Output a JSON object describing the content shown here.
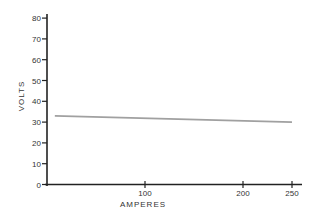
{
  "chart_data": {
    "type": "line",
    "title": "",
    "xlabel": "AMPERES",
    "ylabel": "VOLTS",
    "xlim": [
      0,
      255
    ],
    "ylim": [
      0,
      82
    ],
    "x_ticks": [
      100,
      200,
      250
    ],
    "x_tick_labels": [
      "100",
      "200",
      "250"
    ],
    "y_ticks": [
      0,
      10,
      20,
      30,
      40,
      50,
      60,
      70,
      80
    ],
    "y_tick_labels": [
      "0",
      "10",
      "20",
      "30",
      "40",
      "50",
      "60",
      "70",
      "80"
    ],
    "grid": false,
    "legend": null,
    "series": [
      {
        "name": "Voltage",
        "color": "#a0a0a0",
        "x": [
          8,
          250
        ],
        "y": [
          33,
          30
        ]
      }
    ]
  }
}
